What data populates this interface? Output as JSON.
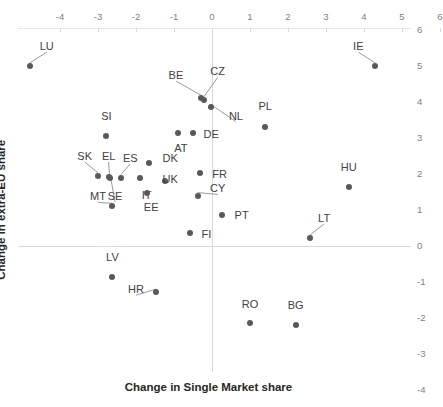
{
  "chart_data": {
    "type": "scatter",
    "title": "",
    "xlabel": "Change in Single Market share",
    "ylabel": "Change in extra-EU share",
    "xlim": [
      -4.6,
      6.4
    ],
    "ylim": [
      -4.6,
      6.4
    ],
    "xticks": [
      -4,
      -3,
      -2,
      -1,
      0,
      1,
      2,
      3,
      4,
      5,
      6
    ],
    "yticks": [
      6,
      5,
      4,
      3,
      2,
      1,
      0,
      -1,
      -2,
      -3,
      -4
    ],
    "xtick_labels": [
      "-4",
      "-3",
      "-2",
      "-1",
      "0",
      "1",
      "2",
      "3",
      "4",
      "5",
      "6"
    ],
    "ytick_labels": [
      "6",
      "5",
      "4",
      "3",
      "2",
      "1",
      "0",
      "-1",
      "-2",
      "-3",
      "-4"
    ],
    "xaxis_position": "top",
    "yaxis_position": "right",
    "grid": false,
    "legend": "none",
    "marker_color": "#595959",
    "axis_color": "#d9d9d9",
    "points": [
      {
        "label": "LU",
        "x": -4.8,
        "y": 5.0,
        "lx": -4.35,
        "ly": 5.55,
        "leader": true
      },
      {
        "label": "IE",
        "x": 4.3,
        "y": 5.0,
        "lx": 3.85,
        "ly": 5.55,
        "leader": true
      },
      {
        "label": "BE",
        "x": -0.28,
        "y": 4.1,
        "lx": -0.95,
        "ly": 4.75,
        "leader": true
      },
      {
        "label": "CZ",
        "x": -0.22,
        "y": 4.05,
        "lx": 0.15,
        "ly": 4.85,
        "leader": true
      },
      {
        "label": "NL",
        "x": -0.03,
        "y": 3.85,
        "lx": 0.63,
        "ly": 3.62,
        "leader": true
      },
      {
        "label": "PL",
        "x": 1.4,
        "y": 3.3,
        "lx": 1.4,
        "ly": 3.9,
        "leader": false
      },
      {
        "label": "DE",
        "x": -0.5,
        "y": 3.15,
        "lx": -0.02,
        "ly": 3.12,
        "leader": false
      },
      {
        "label": "AT",
        "x": -0.9,
        "y": 3.15,
        "lx": -0.82,
        "ly": 2.72,
        "leader": false
      },
      {
        "label": "SI",
        "x": -2.8,
        "y": 3.05,
        "lx": -2.78,
        "ly": 3.62,
        "leader": false
      },
      {
        "label": "DK",
        "x": -1.65,
        "y": 2.3,
        "lx": -1.1,
        "ly": 2.45,
        "leader": false
      },
      {
        "label": "FR",
        "x": -0.32,
        "y": 2.03,
        "lx": 0.2,
        "ly": 2.0,
        "leader": false
      },
      {
        "label": "SK",
        "x": -3.0,
        "y": 1.95,
        "lx": -3.35,
        "ly": 2.5,
        "leader": true
      },
      {
        "label": "EL",
        "x": -2.7,
        "y": 1.92,
        "lx": -2.72,
        "ly": 2.5,
        "leader": true
      },
      {
        "label": "ES",
        "x": -2.4,
        "y": 1.9,
        "lx": -2.15,
        "ly": 2.45,
        "leader": true
      },
      {
        "label": "IT",
        "x": -1.9,
        "y": 1.88,
        "lx": -1.72,
        "ly": 1.42,
        "leader": false
      },
      {
        "label": "UK",
        "x": -1.25,
        "y": 1.8,
        "lx": -1.1,
        "ly": 1.85,
        "leader": false
      },
      {
        "label": "MT",
        "x": -2.62,
        "y": 1.1,
        "lx": -3.0,
        "ly": 1.38,
        "leader": true
      },
      {
        "label": "SE",
        "x": -2.68,
        "y": 1.9,
        "lx": -2.55,
        "ly": 1.38,
        "leader": true
      },
      {
        "label": "CY",
        "x": -0.38,
        "y": 1.4,
        "lx": 0.15,
        "ly": 1.6,
        "leader": true
      },
      {
        "label": "EE",
        "x": -1.7,
        "y": 1.48,
        "lx": -1.6,
        "ly": 1.08,
        "leader": false
      },
      {
        "label": "HU",
        "x": 3.6,
        "y": 1.65,
        "lx": 3.6,
        "ly": 2.2,
        "leader": false
      },
      {
        "label": "PT",
        "x": 0.27,
        "y": 0.85,
        "lx": 0.78,
        "ly": 0.85,
        "leader": false
      },
      {
        "label": "FI",
        "x": -0.57,
        "y": 0.35,
        "lx": -0.15,
        "ly": 0.33,
        "leader": false
      },
      {
        "label": "LT",
        "x": 2.58,
        "y": 0.22,
        "lx": 2.95,
        "ly": 0.78,
        "leader": true
      },
      {
        "label": "LV",
        "x": -2.62,
        "y": -0.85,
        "lx": -2.62,
        "ly": -0.3,
        "leader": false
      },
      {
        "label": "HR",
        "x": -1.47,
        "y": -1.28,
        "lx": -2.0,
        "ly": -1.2,
        "leader": true
      },
      {
        "label": "RO",
        "x": 1.0,
        "y": -2.15,
        "lx": 1.0,
        "ly": -1.6,
        "leader": false
      },
      {
        "label": "BG",
        "x": 2.2,
        "y": -2.2,
        "lx": 2.2,
        "ly": -1.65,
        "leader": false
      }
    ]
  }
}
